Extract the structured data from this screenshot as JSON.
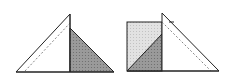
{
  "diagram": {
    "colors": {
      "stroke": "#222222",
      "dark_fill": "#8f8f8f",
      "light_fill": "#d9d9d9",
      "dashed": "#666666",
      "background": "#ffffff"
    },
    "figures": [
      {
        "name": "left-figure",
        "description": "Right triangle with vertical altitude; right part shaded dark, dashed line parallel to hypotenuse"
      },
      {
        "name": "right-figure",
        "description": "Light shaded square overlapped by triangle; dark shaded triangle inside square; dashed line parallel to slanted edge"
      }
    ]
  }
}
